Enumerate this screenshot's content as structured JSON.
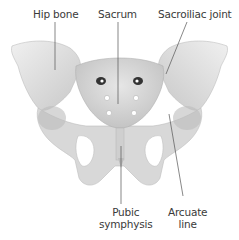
{
  "figure": {
    "colors": {
      "bone": "#dcdcdc",
      "bone_shadow": "#b4b4b4",
      "bone_highlight": "#f2f2f2",
      "foramen_dark": "#3a3a3a",
      "leader_line": "#555555",
      "label_text": "#3a3a3a",
      "background": "#ffffff"
    },
    "labels": [
      {
        "id": "hip-bone",
        "text": "Hip bone"
      },
      {
        "id": "sacrum",
        "text": "Sacrum"
      },
      {
        "id": "sacroiliac-joint",
        "text": "Sacroiliac joint"
      },
      {
        "id": "pubic-symphysis",
        "line1": "Pubic",
        "line2": "symphysis"
      },
      {
        "id": "arcuate-line",
        "line1": "Arcuate",
        "line2": "line"
      }
    ]
  }
}
